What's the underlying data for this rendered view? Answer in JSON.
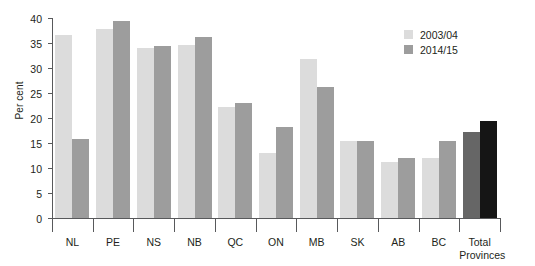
{
  "chart_data": {
    "type": "bar",
    "title": "",
    "xlabel": "",
    "ylabel": "Per cent",
    "ylim": [
      0,
      40
    ],
    "yticks": [
      0,
      5,
      10,
      15,
      20,
      25,
      30,
      35,
      40
    ],
    "grid": false,
    "legend_position": "top-right",
    "categories": [
      "NL",
      "PE",
      "NS",
      "NB",
      "QC",
      "ON",
      "MB",
      "SK",
      "AB",
      "BC",
      "Total\nProvinces"
    ],
    "series": [
      {
        "name": "2003/04",
        "color": "#dcdcdc",
        "values": [
          36.7,
          37.8,
          34.1,
          34.7,
          22.3,
          13.1,
          31.8,
          15.4,
          11.2,
          12.1,
          17.3
        ]
      },
      {
        "name": "2014/15",
        "color": "#9d9d9d",
        "values": [
          15.8,
          39.4,
          34.4,
          36.2,
          23.0,
          18.2,
          26.2,
          15.4,
          12.1,
          15.5,
          19.4
        ]
      }
    ],
    "total_bar_colors": [
      "#666666",
      "#151515"
    ]
  },
  "legend": {
    "items": [
      {
        "label": "2003/04"
      },
      {
        "label": "2014/15"
      }
    ]
  }
}
